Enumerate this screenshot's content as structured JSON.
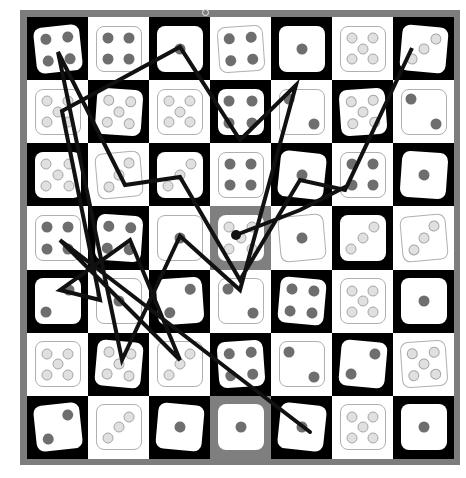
{
  "board": {
    "rows": 7,
    "cols": 7,
    "frame_color": "#7d7d7d",
    "cells": [
      [
        {
          "v": 4,
          "bg": "black",
          "pip": "dark",
          "rot": -6
        },
        {
          "v": 4,
          "bg": "white",
          "pip": "dark",
          "rot": 0
        },
        {
          "v": 1,
          "bg": "black",
          "pip": "dark",
          "rot": 0
        },
        {
          "v": 4,
          "bg": "white",
          "pip": "dark",
          "rot": -4
        },
        {
          "v": 1,
          "bg": "black",
          "pip": "dark",
          "rot": 0
        },
        {
          "v": 5,
          "bg": "white",
          "pip": "light",
          "rot": 0
        },
        {
          "v": 3,
          "bg": "black",
          "pip": "light",
          "rot": 5
        }
      ],
      [
        {
          "v": 5,
          "bg": "white",
          "pip": "light",
          "rot": 0
        },
        {
          "v": 5,
          "bg": "black",
          "pip": "light",
          "rot": 4
        },
        {
          "v": 5,
          "bg": "white",
          "pip": "light",
          "rot": 0
        },
        {
          "v": 4,
          "bg": "black",
          "pip": "dark",
          "rot": 0
        },
        {
          "v": 2,
          "bg": "white",
          "pip": "dark",
          "rot": 0
        },
        {
          "v": 5,
          "bg": "black",
          "pip": "light",
          "rot": -4
        },
        {
          "v": 2,
          "bg": "white",
          "pip": "dark",
          "rot": 0
        }
      ],
      [
        {
          "v": 5,
          "bg": "black",
          "pip": "light",
          "rot": 0
        },
        {
          "v": 3,
          "bg": "white",
          "pip": "light",
          "rot": -5
        },
        {
          "v": 3,
          "bg": "black",
          "pip": "light",
          "rot": 0
        },
        {
          "v": 4,
          "bg": "white",
          "pip": "dark",
          "rot": 0
        },
        {
          "v": 1,
          "bg": "black",
          "pip": "dark",
          "rot": 6
        },
        {
          "v": 4,
          "bg": "white",
          "pip": "dark",
          "rot": 0
        },
        {
          "v": 1,
          "bg": "black",
          "pip": "dark",
          "rot": 4
        }
      ],
      [
        {
          "v": 4,
          "bg": "white",
          "pip": "dark",
          "rot": 0
        },
        {
          "v": 4,
          "bg": "black",
          "pip": "dark",
          "rot": 4
        },
        {
          "v": 1,
          "bg": "white",
          "pip": "dark",
          "rot": 0
        },
        {
          "v": 5,
          "bg": "gray",
          "pip": "light",
          "rot": 0
        },
        {
          "v": 1,
          "bg": "white",
          "pip": "dark",
          "rot": -5
        },
        {
          "v": 3,
          "bg": "black",
          "pip": "light",
          "rot": 0
        },
        {
          "v": 3,
          "bg": "white",
          "pip": "light",
          "rot": -5
        }
      ],
      [
        {
          "v": 2,
          "bg": "black",
          "pip": "dark",
          "rot": 0
        },
        {
          "v": 1,
          "bg": "white",
          "pip": "dark",
          "rot": 0
        },
        {
          "v": 2,
          "bg": "black",
          "pip": "dark",
          "rot": -4
        },
        {
          "v": 2,
          "bg": "white",
          "pip": "dark",
          "rot": 0
        },
        {
          "v": 4,
          "bg": "black",
          "pip": "dark",
          "rot": 5
        },
        {
          "v": 5,
          "bg": "white",
          "pip": "light",
          "rot": 0
        },
        {
          "v": 1,
          "bg": "black",
          "pip": "dark",
          "rot": 0
        }
      ],
      [
        {
          "v": 5,
          "bg": "white",
          "pip": "light",
          "rot": 0
        },
        {
          "v": 5,
          "bg": "black",
          "pip": "light",
          "rot": 5
        },
        {
          "v": 3,
          "bg": "white",
          "pip": "light",
          "rot": 0
        },
        {
          "v": 4,
          "bg": "black",
          "pip": "dark",
          "rot": -4
        },
        {
          "v": 2,
          "bg": "white",
          "pip": "dark",
          "rot": 0
        },
        {
          "v": 2,
          "bg": "black",
          "pip": "dark",
          "rot": 5
        },
        {
          "v": 5,
          "bg": "white",
          "pip": "light",
          "rot": -4
        }
      ],
      [
        {
          "v": 2,
          "bg": "black",
          "pip": "dark",
          "rot": -6
        },
        {
          "v": 3,
          "bg": "white",
          "pip": "light",
          "rot": 0
        },
        {
          "v": 1,
          "bg": "black",
          "pip": "dark",
          "rot": 5
        },
        {
          "v": 1,
          "bg": "gray",
          "pip": "dark",
          "rot": 0
        },
        {
          "v": 1,
          "bg": "black",
          "pip": "dark",
          "rot": 6
        },
        {
          "v": 5,
          "bg": "white",
          "pip": "light",
          "rot": 0
        },
        {
          "v": 1,
          "bg": "black",
          "pip": "dark",
          "rot": 0
        }
      ]
    ]
  },
  "path": {
    "color": "#111111",
    "points": "236,235 300,210 347,186 412,48 345,190 300,180 240,280 180,177 125,185 58,52 122,360 180,236 240,290 296,85 240,140 180,47 62,111 100,300 60,290 130,240 180,360 60,240 310,432",
    "start_dot": {
      "x": 236,
      "y": 235
    }
  }
}
